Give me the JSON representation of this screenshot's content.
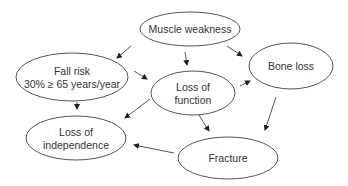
{
  "diagram": {
    "type": "concept-flow",
    "colors": {
      "stroke": "#555555",
      "text": "#333333",
      "background": "#ffffff"
    },
    "nodes": [
      {
        "id": "muscle_weakness",
        "lines": [
          "Muscle weakness"
        ],
        "cx": 190,
        "cy": 29,
        "rx": 50,
        "ry": 17
      },
      {
        "id": "fall_risk",
        "lines": [
          "Fall risk",
          "30% ≥ 65 years/year"
        ],
        "cx": 72,
        "cy": 77,
        "rx": 56,
        "ry": 24
      },
      {
        "id": "loss_of_function",
        "lines": [
          "Loss of",
          "function"
        ],
        "cx": 193,
        "cy": 93,
        "rx": 42,
        "ry": 22
      },
      {
        "id": "bone_loss",
        "lines": [
          "Bone loss"
        ],
        "cx": 291,
        "cy": 66,
        "rx": 42,
        "ry": 23
      },
      {
        "id": "loss_of_independence",
        "lines": [
          "Loss of",
          "independence"
        ],
        "cx": 76,
        "cy": 138,
        "rx": 50,
        "ry": 22
      },
      {
        "id": "fracture",
        "lines": [
          "Fracture"
        ],
        "cx": 228,
        "cy": 158,
        "rx": 50,
        "ry": 21
      }
    ],
    "edges": [
      {
        "from": "muscle_weakness",
        "to": "fall_risk",
        "x1": 131,
        "y1": 46,
        "x2": 117,
        "y2": 58
      },
      {
        "from": "muscle_weakness",
        "to": "loss_of_function",
        "x1": 185,
        "y1": 52,
        "x2": 187,
        "y2": 65
      },
      {
        "from": "muscle_weakness",
        "to": "bone_loss",
        "x1": 227,
        "y1": 46,
        "x2": 242,
        "y2": 56
      },
      {
        "from": "fall_risk",
        "to": "loss_of_function",
        "x1": 134,
        "y1": 71,
        "x2": 147,
        "y2": 79
      },
      {
        "from": "fall_risk",
        "to": "loss_of_independence",
        "x1": 77,
        "y1": 102,
        "x2": 77,
        "y2": 109
      },
      {
        "from": "loss_of_function",
        "to": "bone_loss",
        "x1": 240,
        "y1": 86,
        "x2": 250,
        "y2": 81
      },
      {
        "from": "loss_of_function",
        "to": "loss_of_independence",
        "x1": 150,
        "y1": 99,
        "x2": 125,
        "y2": 118
      },
      {
        "from": "loss_of_function",
        "to": "fracture",
        "x1": 197,
        "y1": 112,
        "x2": 209,
        "y2": 131
      },
      {
        "from": "bone_loss",
        "to": "fracture",
        "x1": 276,
        "y1": 97,
        "x2": 265,
        "y2": 130
      },
      {
        "from": "fracture",
        "to": "loss_of_independence",
        "x1": 174,
        "y1": 153,
        "x2": 134,
        "y2": 145
      }
    ]
  }
}
